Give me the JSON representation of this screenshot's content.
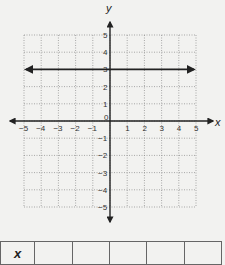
{
  "chart_data": {
    "type": "line",
    "title": "",
    "xlabel": "x",
    "ylabel": "y",
    "xlim": [
      -5,
      5
    ],
    "ylim": [
      -5,
      5
    ],
    "grid": true,
    "x_ticks": [
      "-5",
      "-4",
      "-3",
      "-2",
      "-1",
      "0",
      "1",
      "2",
      "3",
      "4",
      "5"
    ],
    "y_ticks": [
      "5",
      "4",
      "3",
      "2",
      "1",
      "-1",
      "-2",
      "-3",
      "-4",
      "-5"
    ],
    "series": [
      {
        "name": "y = 3",
        "equation": "y = 3",
        "x": [
          -5,
          5
        ],
        "y": [
          3,
          3
        ],
        "arrows_both_ends": true
      }
    ]
  },
  "table": {
    "header": "x",
    "cells": [
      "",
      "",
      "",
      "",
      ""
    ]
  },
  "colors": {
    "background": "#f2f2f0",
    "axis": "#222222",
    "grid": "#888888",
    "line": "#222222"
  }
}
